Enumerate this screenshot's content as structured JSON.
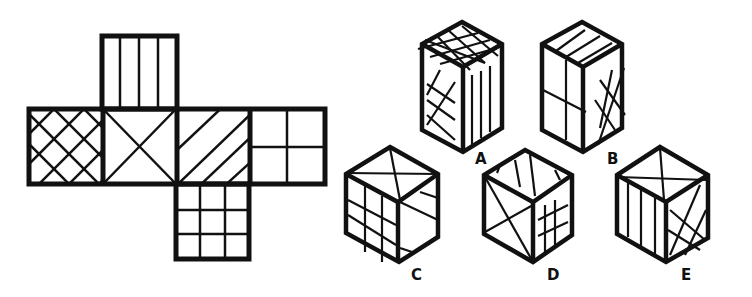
{
  "puzzle": {
    "type": "cube-net folding",
    "net_faces": [
      {
        "position": "top",
        "pattern": "vertical-stripes"
      },
      {
        "position": "row-1",
        "pattern": "diagonal-crosshatch"
      },
      {
        "position": "row-2",
        "pattern": "x-diagonals"
      },
      {
        "position": "row-3",
        "pattern": "diagonal-stripes"
      },
      {
        "position": "row-4",
        "pattern": "2x2-grid"
      },
      {
        "position": "bottom",
        "pattern": "3x3-grid"
      }
    ],
    "options": [
      {
        "label": "A",
        "top": "grid",
        "left": "crosshatch",
        "right": "vertical-stripes"
      },
      {
        "label": "B",
        "top": "diagonal-stripes",
        "left": "2x2-grid",
        "right": "crosshatch"
      },
      {
        "label": "C",
        "top": "x-diagonals",
        "left": "3x3-grid",
        "right": "diagonal-stripes"
      },
      {
        "label": "D",
        "top": "vertical-stripes",
        "left": "x-diagonals",
        "right": "3x3-grid"
      },
      {
        "label": "E",
        "top": "x-diagonals",
        "left": "vertical-stripes",
        "right": "crosshatch"
      }
    ]
  },
  "colors": {
    "ink": "#111111",
    "background": "#ffffff"
  }
}
